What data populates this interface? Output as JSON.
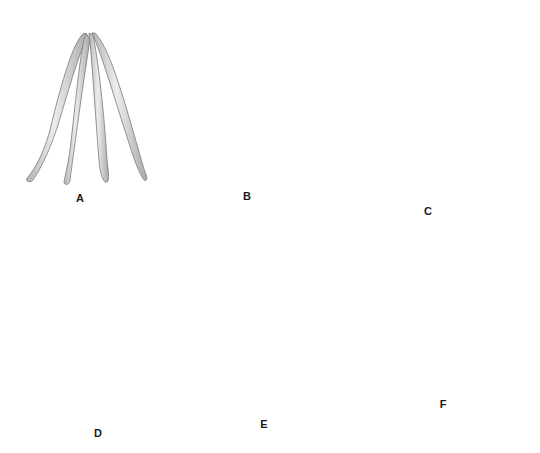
{
  "diagram": {
    "panels": [
      {
        "id": "A",
        "label": "A",
        "step": "four strands joined at top, spread apart",
        "arrow": "none"
      },
      {
        "id": "B",
        "label": "B",
        "step": "rightmost strand crossed leftward",
        "arrow": "right-to-left"
      },
      {
        "id": "C",
        "label": "C",
        "step": "leftmost strand crossed rightward",
        "arrow": "left-to-right"
      },
      {
        "id": "D",
        "label": "D",
        "step": "strand crossed rightward under/over",
        "arrow": "left-to-right"
      },
      {
        "id": "E",
        "label": "E",
        "step": "rightmost strand crossed leftward",
        "arrow": "right-to-left"
      },
      {
        "id": "F",
        "label": "F",
        "step": "finished braid",
        "arrow": "none"
      }
    ],
    "colors": {
      "strand_fill": "#d9d9d9",
      "strand_stroke": "#7a7a7a",
      "arrow": "#111111",
      "background": "#ffffff"
    }
  }
}
